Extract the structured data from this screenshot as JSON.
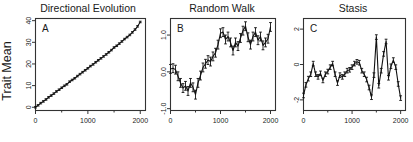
{
  "figure": {
    "ylabel": "Trait Mean",
    "background": "#ffffff",
    "line_color": "#111111",
    "axis_color": "#333333"
  },
  "chart_data": [
    {
      "type": "line",
      "title": "Directional Evolution",
      "panel_letter": "A",
      "xlabel": "",
      "ylabel": "Trait Mean",
      "xlim": [
        0,
        2100
      ],
      "ylim": [
        -1.5,
        41
      ],
      "xticks": [
        0,
        1000,
        2000
      ],
      "xticklabels": [
        "0",
        "1000",
        "2000"
      ],
      "yticks": [
        0,
        10,
        20,
        30,
        40
      ],
      "yticklabels": [
        "0",
        "10",
        "20",
        "30",
        "40"
      ],
      "grid": false,
      "legend": "none",
      "errorbars": true,
      "x": [
        0,
        50,
        100,
        150,
        200,
        250,
        300,
        350,
        400,
        450,
        500,
        550,
        600,
        650,
        700,
        750,
        800,
        850,
        900,
        950,
        1000,
        1050,
        1100,
        1150,
        1200,
        1250,
        1300,
        1350,
        1400,
        1450,
        1500,
        1550,
        1600,
        1650,
        1700,
        1750,
        1800,
        1850,
        1900,
        1950,
        2000
      ],
      "values": [
        0.0,
        0.9,
        1.9,
        2.7,
        3.6,
        4.6,
        5.4,
        6.3,
        7.3,
        8.1,
        9.0,
        9.9,
        10.6,
        11.8,
        12.6,
        13.4,
        14.4,
        15.3,
        16.2,
        17.1,
        18.0,
        19.0,
        19.8,
        20.8,
        21.7,
        22.6,
        23.5,
        24.4,
        25.4,
        26.4,
        27.6,
        28.4,
        29.4,
        30.4,
        31.5,
        32.4,
        33.4,
        34.6,
        35.9,
        37.4,
        39.4
      ],
      "errors": [
        0.35,
        0.35,
        0.35,
        0.35,
        0.35,
        0.35,
        0.35,
        0.35,
        0.35,
        0.35,
        0.35,
        0.35,
        0.35,
        0.35,
        0.35,
        0.35,
        0.35,
        0.35,
        0.35,
        0.35,
        0.35,
        0.35,
        0.35,
        0.35,
        0.35,
        0.35,
        0.35,
        0.35,
        0.35,
        0.35,
        0.35,
        0.35,
        0.35,
        0.35,
        0.35,
        0.35,
        0.35,
        0.35,
        0.35,
        0.35,
        0.35
      ]
    },
    {
      "type": "line",
      "title": "Random Walk",
      "panel_letter": "B",
      "xlabel": "",
      "ylabel": "",
      "xlim": [
        0,
        2100
      ],
      "ylim": [
        -1.05,
        1.45
      ],
      "xticks": [
        0,
        1000,
        2000
      ],
      "xticklabels": [
        "0",
        "1000",
        "2000"
      ],
      "yticks": [
        -1.0,
        0.0,
        1.0
      ],
      "yticklabels": [
        "-1.0",
        "0.0",
        "1.0"
      ],
      "grid": false,
      "legend": "none",
      "errorbars": true,
      "x": [
        0,
        50,
        100,
        150,
        200,
        250,
        300,
        350,
        400,
        450,
        500,
        550,
        600,
        650,
        700,
        750,
        800,
        850,
        900,
        950,
        1000,
        1050,
        1100,
        1150,
        1200,
        1250,
        1300,
        1350,
        1400,
        1450,
        1500,
        1550,
        1600,
        1650,
        1700,
        1750,
        1800,
        1850,
        1900,
        1950,
        2000
      ],
      "values": [
        0.08,
        0.1,
        0.06,
        -0.12,
        -0.3,
        -0.44,
        -0.38,
        -0.52,
        -0.3,
        -0.42,
        -0.62,
        -0.3,
        -0.1,
        0.12,
        0.22,
        0.32,
        0.28,
        0.42,
        0.52,
        0.74,
        1.05,
        1.08,
        0.88,
        0.96,
        0.8,
        0.58,
        0.8,
        0.7,
        0.92,
        1.12,
        1.24,
        0.94,
        0.74,
        0.96,
        1.08,
        0.86,
        0.96,
        0.72,
        0.8,
        0.9,
        1.22
      ],
      "errors": [
        0.12,
        0.12,
        0.12,
        0.12,
        0.12,
        0.12,
        0.12,
        0.12,
        0.12,
        0.12,
        0.12,
        0.12,
        0.12,
        0.12,
        0.12,
        0.12,
        0.12,
        0.12,
        0.12,
        0.12,
        0.12,
        0.12,
        0.12,
        0.12,
        0.12,
        0.12,
        0.12,
        0.12,
        0.12,
        0.12,
        0.12,
        0.12,
        0.12,
        0.12,
        0.12,
        0.12,
        0.12,
        0.12,
        0.12,
        0.12,
        0.12
      ]
    },
    {
      "type": "line",
      "title": "Stasis",
      "panel_letter": "C",
      "xlabel": "",
      "ylabel": "",
      "xlim": [
        0,
        2100
      ],
      "ylim": [
        -2.6,
        2.6
      ],
      "xticks": [
        0,
        1000,
        2000
      ],
      "xticklabels": [
        "0",
        "1000",
        "2000"
      ],
      "yticks": [
        -2,
        0,
        2
      ],
      "yticklabels": [
        "-2",
        "0",
        "2"
      ],
      "grid": false,
      "legend": "none",
      "errorbars": true,
      "x": [
        0,
        50,
        100,
        150,
        200,
        250,
        300,
        350,
        400,
        450,
        500,
        550,
        600,
        650,
        700,
        750,
        800,
        850,
        900,
        950,
        1000,
        1050,
        1100,
        1150,
        1200,
        1250,
        1300,
        1350,
        1400,
        1450,
        1500,
        1550,
        1600,
        1650,
        1700,
        1750,
        1800,
        1850,
        1900,
        1950,
        2000
      ],
      "values": [
        -1.75,
        -1.15,
        -0.8,
        -0.55,
        0.05,
        -0.55,
        -0.7,
        -0.5,
        -0.9,
        -0.55,
        -0.4,
        -0.15,
        0.05,
        -0.55,
        -1.05,
        -0.6,
        -0.7,
        -0.55,
        -0.35,
        -0.3,
        -0.15,
        0.05,
        0.15,
        0.1,
        -0.35,
        -0.55,
        -0.85,
        -1.3,
        -1.85,
        -0.6,
        1.55,
        -1.2,
        -0.35,
        0.6,
        1.3,
        -0.75,
        -0.1,
        0.25,
        -0.15,
        -1.1,
        -1.9
      ],
      "errors": [
        0.13,
        0.13,
        0.13,
        0.13,
        0.13,
        0.13,
        0.13,
        0.13,
        0.13,
        0.13,
        0.13,
        0.13,
        0.13,
        0.13,
        0.13,
        0.13,
        0.13,
        0.13,
        0.13,
        0.13,
        0.13,
        0.13,
        0.13,
        0.13,
        0.13,
        0.13,
        0.13,
        0.13,
        0.13,
        0.13,
        0.13,
        0.13,
        0.13,
        0.13,
        0.13,
        0.13,
        0.13,
        0.13,
        0.13,
        0.13,
        0.13
      ]
    }
  ]
}
